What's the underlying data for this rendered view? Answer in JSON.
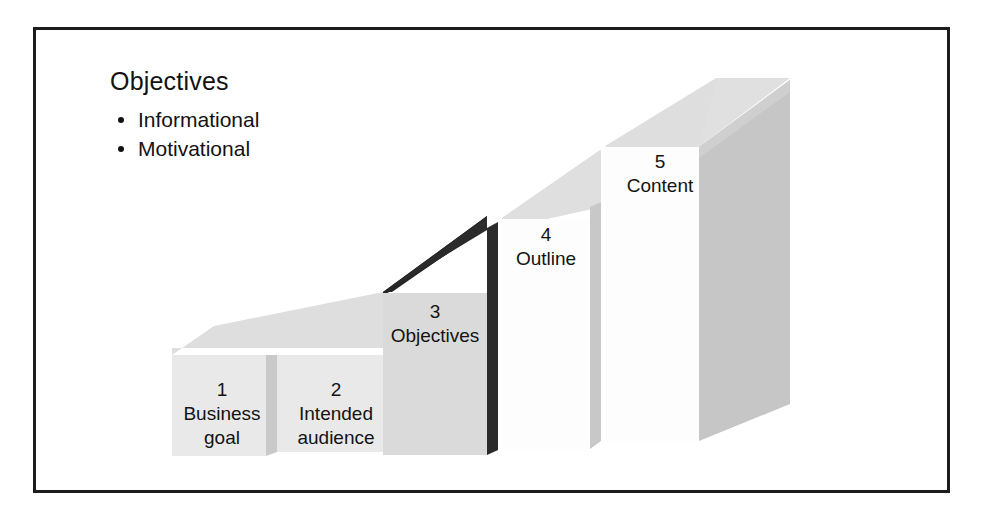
{
  "figure": {
    "legend": {
      "title": "Objectives",
      "bullets": [
        {
          "label": "Informational"
        },
        {
          "label": "Motivational"
        }
      ]
    },
    "steps": [
      {
        "number": "1",
        "label": "Business\ngoal",
        "highlighted": false
      },
      {
        "number": "2",
        "label": "Intended\naudience",
        "highlighted": false
      },
      {
        "number": "3",
        "label": "Objectives",
        "highlighted": true
      },
      {
        "number": "4",
        "label": "Outline",
        "highlighted": false
      },
      {
        "number": "5",
        "label": "Content",
        "highlighted": false
      }
    ],
    "colors": {
      "frame_border": "#1c1c1c",
      "text": "#131313",
      "background": "#ffffff",
      "block_front_light": "#e6e6e6",
      "block_front_white": "#fdfdfd",
      "block_top_light": "#dcdcdc",
      "block_side_gray": "#c2c2c2",
      "block_side_dark": "#2b2b2b",
      "block_top_dark": "#262626"
    }
  }
}
